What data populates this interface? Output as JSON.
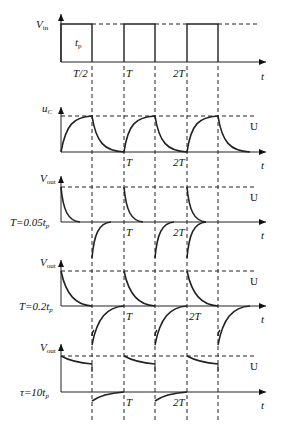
{
  "diagram": {
    "panels": [
      {
        "id": "vin",
        "ylabel": "V",
        "ysub": "in",
        "inner_label": "t",
        "inner_sub": "p",
        "ticks": [
          "T/2",
          "T",
          "2T"
        ],
        "xlabel": "t"
      },
      {
        "id": "uc",
        "ylabel": "u",
        "ysub": "C",
        "level_label": "U",
        "ticks": [
          "T",
          "2T"
        ],
        "xlabel": "t"
      },
      {
        "id": "vout1",
        "ylabel": "V",
        "ysub": "out",
        "side_label": "T=0.05t",
        "side_sub": "p",
        "level_label": "U",
        "ticks": [
          "T",
          "2T"
        ],
        "xlabel": "t"
      },
      {
        "id": "vout2",
        "ylabel": "V",
        "ysub": "out",
        "side_label": "T=0.2t",
        "side_sub": "p",
        "level_label": "U",
        "ticks": [
          "T",
          "2T"
        ],
        "xlabel": "t"
      },
      {
        "id": "vout3",
        "ylabel": "V",
        "ysub": "out",
        "side_label": "τ=10t",
        "side_sub": "p",
        "level_label": "U",
        "ticks": [
          "T",
          "2T"
        ],
        "xlabel": "t"
      }
    ]
  }
}
